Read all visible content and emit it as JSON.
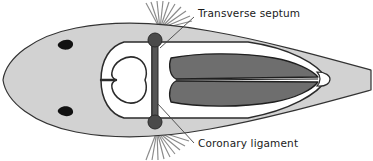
{
  "figure": {
    "title": "Transverse septum and coronary ligament of a fish (ventral view)",
    "canvas": {
      "width": 373,
      "height": 161
    },
    "background_color": "#ffffff"
  },
  "labels": [
    {
      "id": "transverse-septum",
      "text": "Transverse septum",
      "text_x": 198,
      "text_y": 14,
      "leader": {
        "x1": 194,
        "y1": 17,
        "x2": 160,
        "y2": 48
      }
    },
    {
      "id": "coronary-ligament",
      "text": "Coronary ligament",
      "text_x": 198,
      "text_y": 150,
      "leader": {
        "x1": 194,
        "y1": 143,
        "x2": 158,
        "y2": 104
      }
    }
  ],
  "colors": {
    "body_fill": "#d2d2d2",
    "body_outline": "#333333",
    "cavity_fill": "#ffffff",
    "cavity_outline": "#2b2b2b",
    "liver_fill": "#6e6e6e",
    "liver_outline": "#1f1f1f",
    "heart_fill": "#ffffff",
    "heart_outline": "#2b2b2b",
    "ligament_node": "#4a4a4a",
    "ligament_node_outline": "#2a2a2a",
    "septum_bar": "#555555",
    "eye_fill": "#111111",
    "fin_ray": "#8a8a8a",
    "vent_fill": "#ffffff",
    "leader_line": "#444444",
    "label_text": "#1a1a1a"
  },
  "anatomy": {
    "body": {
      "name": "fish-body-outline",
      "description": "Elongate teardrop body, snout at left, tapering tail at right"
    },
    "eyes": [
      {
        "name": "eye-upper",
        "cx": 66,
        "cy": 44
      },
      {
        "name": "eye-lower",
        "cx": 66,
        "cy": 112
      }
    ],
    "fins": [
      {
        "name": "pectoral-fin-upper",
        "base_x": 160,
        "base_y": 27,
        "ray_count": 9
      },
      {
        "name": "pectoral-fin-lower",
        "base_x": 160,
        "base_y": 131,
        "ray_count": 9
      }
    ],
    "pericardial_cavity": {
      "name": "pericardial-cavity",
      "description": "White chamber anterior to the transverse septum containing the heart"
    },
    "heart": {
      "name": "heart",
      "description": "V/U-shaped heart with ventral aorta stem projecting anteriorly"
    },
    "abdominal_cavity": {
      "name": "abdominal-cavity",
      "description": "White peritoneal cavity posterior to the transverse septum"
    },
    "liver": {
      "name": "liver",
      "description": "Two elongate dark lobes filling the abdominal cavity, split by a median fissure"
    },
    "transverse_septum": {
      "name": "transverse-septum",
      "description": "Vertical partition separating pericardial from abdominal cavity",
      "x": 155,
      "y_top": 38,
      "y_bottom": 123
    },
    "coronary_ligaments": [
      {
        "name": "coronary-ligament-node-upper",
        "cx": 155,
        "cy": 40,
        "r": 7
      },
      {
        "name": "coronary-ligament-node-lower",
        "cx": 155,
        "cy": 122,
        "r": 7
      }
    ],
    "vent": {
      "name": "vent",
      "cx": 322,
      "cy": 79,
      "description": "Small white rounded opening at posterior end of the abdominal cavity"
    }
  }
}
